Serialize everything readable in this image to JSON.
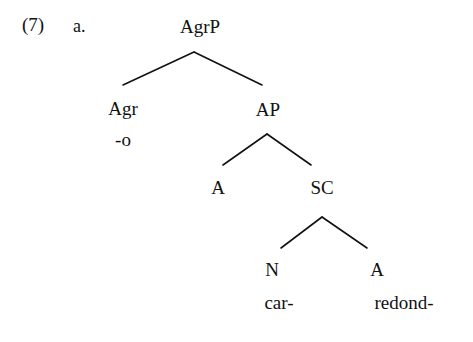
{
  "example": {
    "number": "(7)",
    "letter": "a."
  },
  "tree": {
    "nodes": [
      {
        "id": "agrp",
        "label": "AgrP",
        "x": 200,
        "y": 16
      },
      {
        "id": "agr",
        "label": "Agr",
        "x": 123,
        "y": 98
      },
      {
        "id": "agr-t",
        "label": "-o",
        "x": 123,
        "y": 129
      },
      {
        "id": "ap",
        "label": "AP",
        "x": 268,
        "y": 99
      },
      {
        "id": "a-head",
        "label": "A",
        "x": 218,
        "y": 177
      },
      {
        "id": "sc",
        "label": "SC",
        "x": 322,
        "y": 177
      },
      {
        "id": "n",
        "label": "N",
        "x": 272,
        "y": 259
      },
      {
        "id": "n-t",
        "label": "car-",
        "x": 279,
        "y": 292
      },
      {
        "id": "a-adj",
        "label": "A",
        "x": 377,
        "y": 259
      },
      {
        "id": "a-adj-t",
        "label": "redond-",
        "x": 404,
        "y": 292
      }
    ],
    "branches": [
      {
        "id": "agrp-left",
        "from": [
          194,
          52
        ],
        "to": [
          123,
          85
        ]
      },
      {
        "id": "agrp-right",
        "from": [
          194,
          52
        ],
        "to": [
          262,
          85
        ]
      },
      {
        "id": "ap-left",
        "from": [
          267,
          134
        ],
        "to": [
          223,
          165
        ]
      },
      {
        "id": "ap-right",
        "from": [
          267,
          134
        ],
        "to": [
          311,
          165
        ]
      },
      {
        "id": "sc-left",
        "from": [
          322,
          217
        ],
        "to": [
          281,
          248
        ]
      },
      {
        "id": "sc-right",
        "from": [
          322,
          217
        ],
        "to": [
          367,
          248
        ]
      }
    ],
    "line_color": "#111111",
    "line_width": 1.6
  },
  "canvas": {
    "background": "#ffffff",
    "width": 473,
    "height": 342
  }
}
